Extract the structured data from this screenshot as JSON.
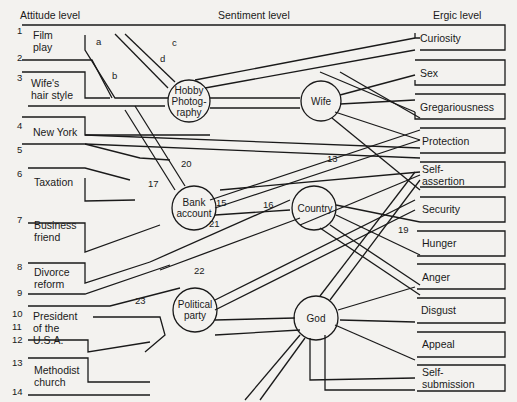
{
  "headers": {
    "attitude": "Attitude level",
    "sentiment": "Sentiment level",
    "ergic": "Ergic level"
  },
  "attitudes": [
    {
      "label": "Film\nplay",
      "numbers": [
        "1",
        "2"
      ]
    },
    {
      "label": "Wife's\nhair style",
      "numbers": [
        "3"
      ]
    },
    {
      "label": "New York",
      "numbers": [
        "4",
        "5"
      ]
    },
    {
      "label": "Taxation",
      "numbers": [
        "6"
      ]
    },
    {
      "label": "Business\nfriend",
      "numbers": [
        "7"
      ]
    },
    {
      "label": "Divorce\nreform",
      "numbers": [
        "8",
        "9"
      ]
    },
    {
      "label": "President\nof the\nU.S.A.",
      "numbers": [
        "10",
        "11",
        "12"
      ]
    },
    {
      "label": "Methodist\nchurch",
      "numbers": [
        "13",
        "14"
      ]
    }
  ],
  "sentiments": [
    {
      "label": "Hobby\nPhotog-\nraphy"
    },
    {
      "label": "Wife"
    },
    {
      "label": "Bank\naccount"
    },
    {
      "label": "Country"
    },
    {
      "label": "Political\nparty"
    },
    {
      "label": "God"
    }
  ],
  "ergs": [
    "Curiosity",
    "Sex",
    "Gregariousness",
    "Protection",
    "Self-\nassertion",
    "Security",
    "Hunger",
    "Anger",
    "Disgust",
    "Appeal",
    "Self-\nsubmission"
  ],
  "path_letters": [
    "a",
    "b",
    "c",
    "d"
  ],
  "path_numbers": [
    "13",
    "15",
    "16",
    "17",
    "19",
    "20",
    "21",
    "22",
    "23"
  ],
  "line_numbers": [
    "1",
    "2",
    "3",
    "4",
    "5",
    "6",
    "7",
    "8",
    "9",
    "10",
    "11",
    "12",
    "13",
    "14"
  ]
}
